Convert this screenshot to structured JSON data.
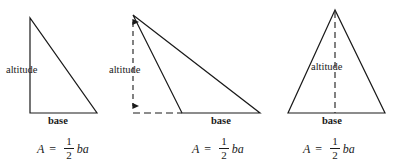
{
  "figure": {
    "background_color": "#ffffff",
    "stroke_color": "#1a1a1a",
    "text_color": "#1a1a1a"
  },
  "panels": [
    {
      "id": "right-triangle",
      "type": "right triangle",
      "altitude_label": "altitude",
      "base_label": "base",
      "formula": {
        "lhs": "A",
        "equals": "=",
        "numerator": "1",
        "denominator": "2",
        "rhs": "ba"
      },
      "geometry": {
        "vertices": [
          [
            30,
            18
          ],
          [
            30,
            113
          ],
          [
            97,
            113
          ]
        ],
        "altitude_segment": [
          [
            30,
            18
          ],
          [
            30,
            113
          ]
        ],
        "base_segment": [
          [
            30,
            113
          ],
          [
            97,
            113
          ]
        ],
        "altitude_is_dashed": false,
        "has_arrows": false
      }
    },
    {
      "id": "obtuse-triangle",
      "type": "obtuse triangle with external altitude",
      "altitude_label": "altitude",
      "base_label": "base",
      "formula": {
        "lhs": "A",
        "equals": "=",
        "numerator": "1",
        "denominator": "2",
        "rhs": "ba"
      },
      "geometry": {
        "vertices": [
          [
            133,
            15
          ],
          [
            182,
            113
          ],
          [
            260,
            113
          ]
        ],
        "altitude_segment": [
          [
            133,
            15
          ],
          [
            133,
            113
          ]
        ],
        "base_segment": [
          [
            182,
            113
          ],
          [
            260,
            113
          ]
        ],
        "base_extension_segment": [
          [
            133,
            113
          ],
          [
            182,
            113
          ]
        ],
        "altitude_is_dashed": true,
        "has_arrows": true
      }
    },
    {
      "id": "acute-triangle",
      "type": "acute isosceles triangle",
      "altitude_label": "altitude",
      "base_label": "base",
      "formula": {
        "lhs": "A",
        "equals": "=",
        "numerator": "1",
        "denominator": "2",
        "rhs": "ba"
      },
      "geometry": {
        "vertices": [
          [
            335,
            10
          ],
          [
            288,
            113
          ],
          [
            385,
            113
          ]
        ],
        "altitude_segment": [
          [
            335,
            10
          ],
          [
            335,
            113
          ]
        ],
        "base_segment": [
          [
            288,
            113
          ],
          [
            385,
            113
          ]
        ],
        "altitude_is_dashed": true,
        "has_arrows": false
      }
    }
  ]
}
